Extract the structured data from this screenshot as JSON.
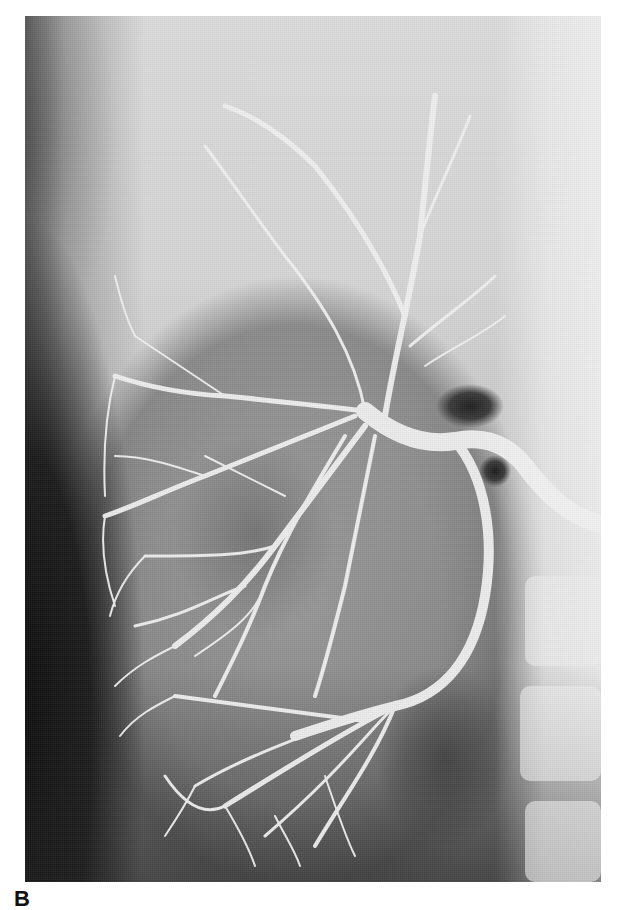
{
  "figure": {
    "panel_label": "B",
    "image_description": "Grayscale renal angiogram showing branching arterial tree of the kidney",
    "colors": {
      "background": "#ffffff",
      "vessel": "#f4f4f4",
      "tissue_light": "#d8d8d8",
      "tissue_dark": "#111111"
    }
  }
}
